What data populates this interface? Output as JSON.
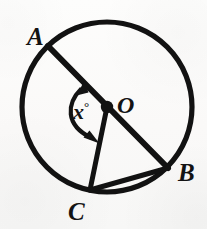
{
  "figure": {
    "kind": "circle-geometry-diagram",
    "canvas": {
      "width": 207,
      "height": 229
    },
    "background_color": "#fbfbfa",
    "ink_color": "#111111",
    "circle": {
      "cx": 107,
      "cy": 107,
      "r": 85,
      "stroke_width": 5
    },
    "center_dot": {
      "cx": 107,
      "cy": 107,
      "r": 6
    },
    "points": [
      {
        "id": "A",
        "label": "A",
        "x": 48,
        "y": 46,
        "label_x": 27,
        "label_y": 24
      },
      {
        "id": "O",
        "label": "O",
        "x": 107,
        "y": 107,
        "label_x": 117,
        "label_y": 93
      },
      {
        "id": "B",
        "label": "B",
        "x": 168,
        "y": 168,
        "label_x": 178,
        "label_y": 160
      },
      {
        "id": "C",
        "label": "C",
        "x": 90,
        "y": 190,
        "label_x": 68,
        "label_y": 199
      }
    ],
    "segments": [
      {
        "id": "diameter-AB",
        "from": "A",
        "to": "B",
        "stroke_width": 6
      },
      {
        "id": "radius-OC",
        "from": "O",
        "to": "C",
        "stroke_width": 5
      },
      {
        "id": "chord-CB",
        "from": "C",
        "to": "B",
        "stroke_width": 5
      }
    ],
    "angle": {
      "id": "angle-AOC",
      "vertex": "O",
      "between": [
        "A",
        "C"
      ],
      "value_text": "x",
      "degree_symbol": "°",
      "label_x": 73,
      "label_y": 100,
      "arc_radius": 40,
      "double_headed": true
    }
  }
}
